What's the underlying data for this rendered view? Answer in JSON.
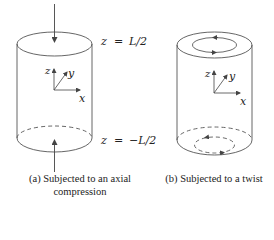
{
  "figure": {
    "panels": [
      {
        "id": "a",
        "caption_line1": "(a) Subjected to an axial",
        "caption_line2": "compression",
        "top_label_var": "z",
        "top_label_eq": "=",
        "top_label_val": "L/2",
        "bottom_label_var": "z",
        "bottom_label_eq": "=",
        "bottom_label_val": "−L/2",
        "axes": {
          "z": "z",
          "y": "y",
          "x": "x"
        },
        "loading": "axial compression arrows at top and bottom"
      },
      {
        "id": "b",
        "caption_line1": "(b) Subjected to a twist",
        "axes": {
          "z": "z",
          "y": "y",
          "x": "x"
        },
        "loading": "twist arrows on top and bottom circular faces"
      }
    ],
    "colors": {
      "line": "#444444",
      "text": "#222222",
      "background": "#ffffff"
    }
  }
}
